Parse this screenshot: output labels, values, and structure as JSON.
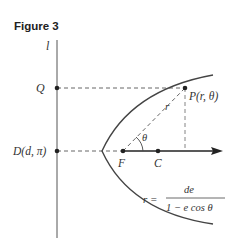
{
  "figure": {
    "title": "Figure 3",
    "line_label": "l",
    "points": {
      "Q": "Q",
      "P": "P(r, θ)",
      "D": "D(d, π)",
      "F": "F",
      "C": "C"
    },
    "segment_label": "r",
    "angle_label": "θ",
    "equation": {
      "lhs": "r =",
      "numerator": "de",
      "denominator": "1 − e cos θ"
    },
    "colors": {
      "curve": "#444444",
      "axis": "#222222",
      "dashed": "#555555"
    }
  }
}
